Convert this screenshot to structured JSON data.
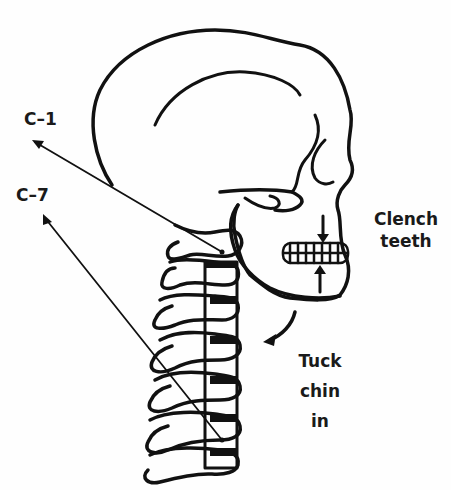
{
  "diagram": {
    "labels": {
      "c1": "C–1",
      "c7": "C–7",
      "clench": [
        "Clench",
        "teeth"
      ],
      "tuck": [
        "Tuck",
        "chin",
        "in"
      ]
    },
    "colors": {
      "background": "#fefefe",
      "ink": "#111111",
      "text": "#1a1a1a"
    }
  }
}
